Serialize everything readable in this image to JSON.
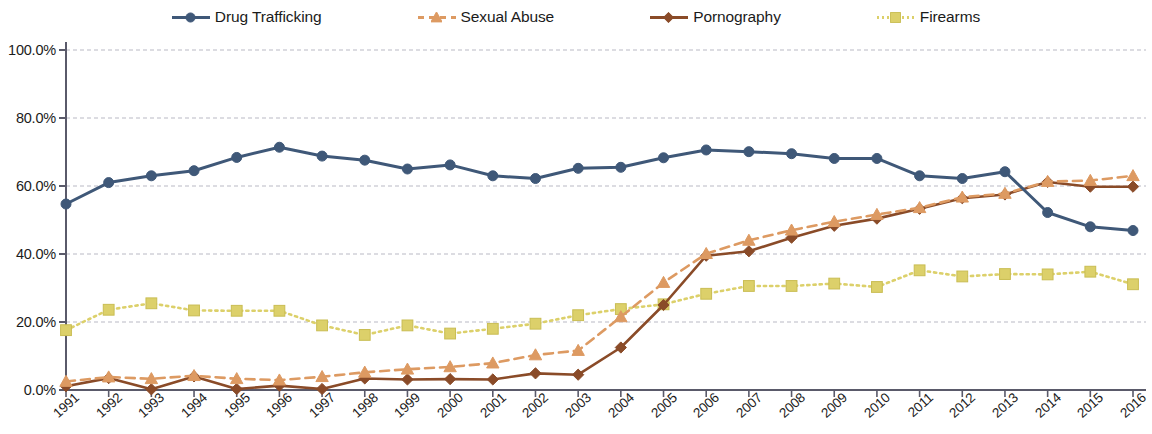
{
  "chart_data": {
    "type": "line",
    "title": "",
    "subtitle": "",
    "xlabel": "",
    "ylabel": "",
    "grid": true,
    "legend_position": "top",
    "ylim": [
      0,
      100
    ],
    "y_ticks": [
      "0.0%",
      "20.0%",
      "40.0%",
      "60.0%",
      "80.0%",
      "100.0%"
    ],
    "y_tick_values": [
      0,
      20,
      40,
      60,
      80,
      100
    ],
    "categories": [
      "1991",
      "1992",
      "1993",
      "1994",
      "1995",
      "1996",
      "1997",
      "1998",
      "1999",
      "2000",
      "2001",
      "2002",
      "2003",
      "2004",
      "2005",
      "2006",
      "2007",
      "2008",
      "2009",
      "2010",
      "2011",
      "2012",
      "2013",
      "2014",
      "2015",
      "2016"
    ],
    "series": [
      {
        "name": "Drug Trafficking",
        "color": "#3f5878",
        "marker": "circle",
        "dash": "solid",
        "values": [
          54.7,
          61.0,
          63.0,
          64.5,
          68.4,
          71.4,
          68.8,
          67.6,
          65.0,
          66.2,
          63.0,
          62.2,
          65.2,
          65.5,
          68.3,
          70.6,
          70.1,
          69.5,
          68.1,
          68.1,
          63.0,
          62.2,
          64.2,
          52.2,
          48.0,
          46.9
        ]
      },
      {
        "name": "Sexual Abuse",
        "color": "#dd9a62",
        "marker": "triangle",
        "dash": "dashed",
        "values": [
          2.5,
          3.8,
          3.3,
          4.2,
          3.3,
          2.9,
          3.9,
          5.2,
          6.1,
          6.8,
          7.9,
          10.3,
          11.6,
          21.5,
          31.6,
          40.1,
          44.0,
          47.0,
          49.5,
          51.6,
          53.6,
          56.7,
          57.8,
          61.3,
          61.6,
          63.0
        ]
      },
      {
        "name": "Pornography",
        "color": "#8a4b28",
        "marker": "diamond",
        "dash": "solid",
        "values": [
          1.1,
          3.5,
          0.2,
          4.0,
          0.3,
          1.3,
          0.3,
          3.4,
          3.1,
          3.2,
          3.1,
          4.9,
          4.5,
          12.5,
          25.0,
          39.5,
          40.8,
          44.8,
          48.3,
          50.4,
          53.3,
          56.4,
          57.5,
          61.2,
          59.8,
          59.8
        ]
      },
      {
        "name": "Firearms",
        "color": "#dcd06a",
        "marker": "square",
        "dash": "dotted",
        "values": [
          17.6,
          23.6,
          25.5,
          23.4,
          23.3,
          23.3,
          19.0,
          16.2,
          19.0,
          16.6,
          18.0,
          19.5,
          22.0,
          23.8,
          25.2,
          28.3,
          30.6,
          30.6,
          31.3,
          30.3,
          35.2,
          33.4,
          34.1,
          34.0,
          34.8,
          31.1
        ]
      }
    ]
  },
  "legend": {
    "items": [
      {
        "label": "Drug Trafficking",
        "color": "#3f5878"
      },
      {
        "label": "Sexual Abuse",
        "color": "#dd9a62"
      },
      {
        "label": "Pornography",
        "color": "#8a4b28"
      },
      {
        "label": "Firearms",
        "color": "#dcd06a"
      }
    ]
  }
}
